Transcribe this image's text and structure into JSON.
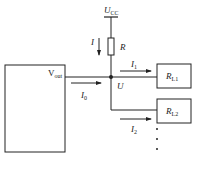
{
  "diagram": {
    "supply": {
      "label": "U",
      "subscript": "CC"
    },
    "resistor": {
      "label": "R"
    },
    "supply_current": {
      "label": "I"
    },
    "source_block": {
      "label": "V",
      "subscript": "out"
    },
    "output_current": {
      "label": "I",
      "subscript": "0"
    },
    "node": {
      "label": "U"
    },
    "branch1": {
      "current_label": "I",
      "current_subscript": "1",
      "load_label": "R",
      "load_subscript": "L1"
    },
    "branch2": {
      "current_label": "I",
      "current_subscript": "2",
      "load_label": "R",
      "load_subscript": "L2"
    },
    "continuation": "⋮",
    "colors": {
      "line": "#222222",
      "background": "#ffffff"
    }
  }
}
